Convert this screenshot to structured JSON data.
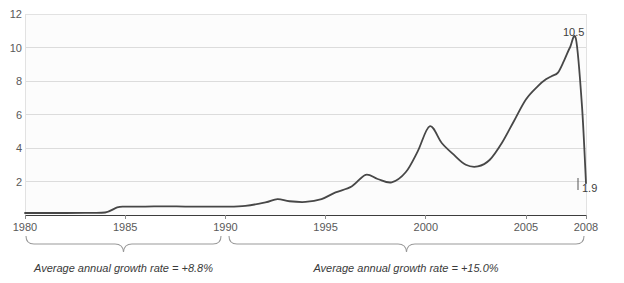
{
  "chart_data": {
    "type": "line",
    "title": "",
    "xlabel": "",
    "ylabel": "",
    "xlim": [
      1980,
      2008
    ],
    "ylim": [
      0,
      12
    ],
    "grid": true,
    "legend": null,
    "y_ticks": [
      "12",
      "10",
      "8",
      "6",
      "4",
      "2"
    ],
    "y_tick_values": [
      12,
      10,
      8,
      6,
      4,
      2
    ],
    "x_ticks": [
      "1980",
      "1985",
      "1990",
      "1995",
      "2000",
      "2005",
      "2008"
    ],
    "x_tick_values": [
      1980,
      1985,
      1990,
      1995,
      2000,
      2005,
      2008
    ],
    "series": [
      {
        "name": "value",
        "x": [
          1980,
          1981,
          1982,
          1983,
          1984,
          1984.6,
          1985,
          1986,
          1987,
          1988,
          1989,
          1990,
          1991,
          1992,
          1992.6,
          1993.2,
          1994,
          1994.8,
          1995.5,
          1996.3,
          1997,
          1997.6,
          1998.3,
          1999,
          1999.6,
          2000.2,
          2000.8,
          2001.4,
          2002,
          2002.6,
          2003.2,
          2003.8,
          2004.4,
          2005,
          2005.6,
          2006,
          2006.3,
          2006.6,
          2006.9,
          2007.2,
          2007.5,
          2007.8,
          2008
        ],
        "y": [
          0.12,
          0.12,
          0.12,
          0.13,
          0.15,
          0.45,
          0.5,
          0.5,
          0.52,
          0.5,
          0.5,
          0.5,
          0.55,
          0.75,
          0.95,
          0.82,
          0.78,
          0.95,
          1.35,
          1.7,
          2.4,
          2.15,
          1.95,
          2.55,
          3.8,
          5.3,
          4.3,
          3.6,
          3.0,
          2.9,
          3.3,
          4.3,
          5.6,
          6.9,
          7.7,
          8.1,
          8.3,
          8.5,
          9.2,
          10.0,
          10.5,
          6.5,
          1.9
        ]
      }
    ],
    "point_labels": [
      {
        "text": "10.5",
        "x": 2007.45,
        "y": 10.5
      },
      {
        "text": "1.9",
        "x": 2008.0,
        "y": 1.9
      }
    ],
    "annotations": [
      {
        "id": "brace-left",
        "label": "Average annual growth rate = +8.8%",
        "from": 1980,
        "to": 1990
      },
      {
        "id": "brace-right",
        "label": "Average annual growth rate = +15.0%",
        "from": 1990,
        "to": 2008
      }
    ],
    "colors": {
      "line": "#474747",
      "grid": "#d9d9d9",
      "axis": "#404040",
      "plot_background": "#fcfcfc",
      "tick_text": "#595959",
      "brace": "#8c8c8c"
    }
  },
  "top_clipped_title": ""
}
